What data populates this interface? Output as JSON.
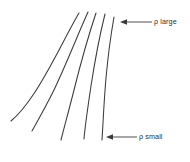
{
  "figure": {
    "type": "line-diagram",
    "background_color": "#ffffff",
    "line_color": "#3a3a3a",
    "text_color": "#2e2e2e",
    "width": 190,
    "height": 162
  },
  "annotations": [
    {
      "id": "rho-large",
      "label": "ρ large",
      "symbol": "ρ",
      "qualifier": "large",
      "arrow_direction": "left",
      "points_to": "rightmost-curve-top"
    },
    {
      "id": "rho-small",
      "label": "ρ small",
      "symbol": "ρ",
      "qualifier": "small",
      "arrow_direction": "left",
      "points_to": "rightmost-curve-bottom"
    }
  ],
  "curves": [
    {
      "id": "curve-1",
      "order": 1,
      "description": "leftmost, most curved, shallowest tail",
      "path": "M 79 13 C 66 35, 50 70, 33 95 C 25 107, 17 116, 11 121"
    },
    {
      "id": "curve-2",
      "order": 2,
      "description": "second from left",
      "path": "M 88 12 C 78 34, 66 65, 53 92 C 45 108, 37 122, 32 131"
    },
    {
      "id": "curve-3",
      "order": 3,
      "description": "middle curve",
      "path": "M 96 13 C 89 34, 81 62, 74 90 C 69 110, 64 128, 61 140"
    },
    {
      "id": "curve-4",
      "order": 4,
      "description": "second from right",
      "path": "M 105 14 C 100 34, 95 60, 91 86 C 88 106, 85 126, 84 139"
    },
    {
      "id": "curve-5",
      "order": 5,
      "description": "rightmost, nearly vertical",
      "path": "M 114 17 C 111 34, 108 56, 106 78 C 104 100, 103 125, 102 140"
    }
  ],
  "leaders": [
    {
      "id": "leader-top",
      "tip_x": 120,
      "tip_y": 22,
      "tail_x": 152,
      "tail_y": 22
    },
    {
      "id": "leader-bottom",
      "tip_x": 106,
      "tip_y": 137,
      "tail_x": 137,
      "tail_y": 137
    }
  ]
}
